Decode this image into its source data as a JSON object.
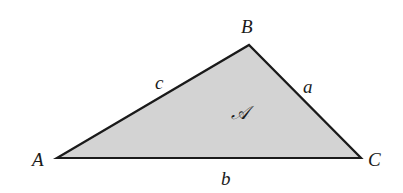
{
  "diagram": {
    "type": "triangle",
    "fill_color": "#d3d3d3",
    "stroke_color": "#1a1a1a",
    "vertices": [
      {
        "name": "A",
        "x": 57,
        "y": 158
      },
      {
        "name": "B",
        "x": 249,
        "y": 45
      },
      {
        "name": "C",
        "x": 361,
        "y": 158
      }
    ],
    "vertex_labels": {
      "A": "A",
      "B": "B",
      "C": "C"
    },
    "side_labels": {
      "a": "a",
      "b": "b",
      "c": "c"
    },
    "area_label": "𝒜"
  }
}
